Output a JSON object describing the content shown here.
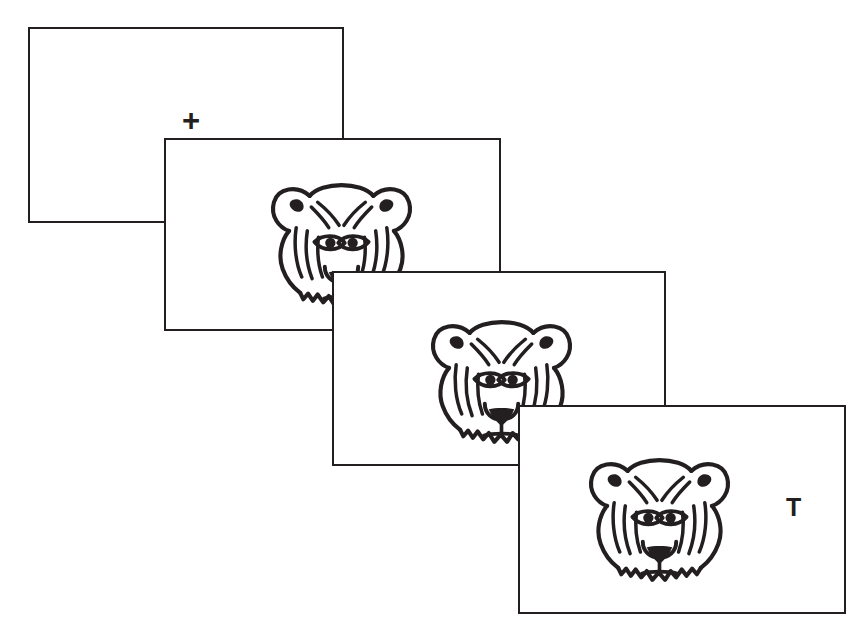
{
  "figure": {
    "background_color": "#ffffff",
    "stroke_color": "#231f20",
    "canvas": {
      "width": 867,
      "height": 641
    }
  },
  "panels": [
    {
      "id": "panel-1",
      "name": "fixation-screen",
      "order": 1,
      "x": 28,
      "y": 27,
      "width": 316,
      "height": 196,
      "contents": {
        "fixation_cross": {
          "label": "+",
          "x": 152,
          "y": 76,
          "font_size": 31
        }
      }
    },
    {
      "id": "panel-2",
      "name": "tiger-screen-first",
      "order": 2,
      "x": 164,
      "y": 138,
      "width": 337,
      "height": 193,
      "contents": {
        "tiger": {
          "x": 96,
          "y": 24,
          "width": 159,
          "height": 156
        }
      }
    },
    {
      "id": "panel-3",
      "name": "tiger-screen-second",
      "order": 3,
      "x": 332,
      "y": 271,
      "width": 334,
      "height": 195,
      "contents": {
        "tiger": {
          "x": 88,
          "y": 28,
          "width": 159,
          "height": 156
        }
      }
    },
    {
      "id": "panel-4",
      "name": "probe-screen",
      "order": 4,
      "x": 518,
      "y": 405,
      "width": 328,
      "height": 209,
      "contents": {
        "tiger": {
          "x": 60,
          "y": 32,
          "width": 159,
          "height": 156
        },
        "probe_letter": {
          "label": "T",
          "x": 266,
          "y": 88,
          "font_size": 25
        }
      }
    }
  ],
  "icons": {
    "tiger_face": "tiger-face-icon",
    "fixation": "fixation-cross-icon"
  }
}
